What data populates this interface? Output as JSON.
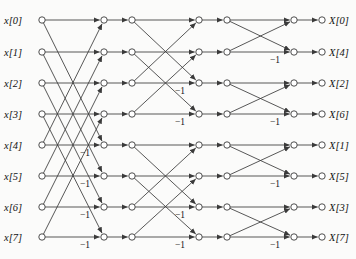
{
  "figure": {
    "stages": 3,
    "n_points": 8,
    "colors": {
      "background": "#fbfbfa",
      "line": "#3a3a3a",
      "node_fill": "#ffffff",
      "text": "#111111"
    }
  },
  "inputs": [
    {
      "label": "x[0]",
      "row": 0
    },
    {
      "label": "x[1]",
      "row": 1
    },
    {
      "label": "x[2]",
      "row": 2
    },
    {
      "label": "x[3]",
      "row": 3
    },
    {
      "label": "x[4]",
      "row": 4
    },
    {
      "label": "x[5]",
      "row": 5
    },
    {
      "label": "x[6]",
      "row": 6
    },
    {
      "label": "x[7]",
      "row": 7
    }
  ],
  "outputs": [
    {
      "label": "X[0]",
      "row": 0
    },
    {
      "label": "X[4]",
      "row": 1
    },
    {
      "label": "X[2]",
      "row": 2
    },
    {
      "label": "X[6]",
      "row": 3
    },
    {
      "label": "X[1]",
      "row": 4
    },
    {
      "label": "X[5]",
      "row": 5
    },
    {
      "label": "X[3]",
      "row": 6
    },
    {
      "label": "X[7]",
      "row": 7
    }
  ],
  "geometry": {
    "row_y": [
      20,
      52,
      83,
      114,
      145,
      176,
      207,
      237
    ],
    "col_x": [
      42,
      104,
      132,
      199,
      227,
      294,
      322
    ],
    "node_r": 3.2
  },
  "stages_detail": [
    {
      "index": 1,
      "span": 4,
      "from_col": 0,
      "to_col": 1,
      "butterflies": [
        {
          "top_row": 0,
          "bot_row": 4
        },
        {
          "top_row": 1,
          "bot_row": 5
        },
        {
          "top_row": 2,
          "bot_row": 6
        },
        {
          "top_row": 3,
          "bot_row": 7
        }
      ],
      "twiddles": [
        {
          "row": 4,
          "base": "W",
          "sub": "N",
          "sup": "0"
        },
        {
          "row": 5,
          "base": "W",
          "sub": "N",
          "sup": "1"
        },
        {
          "row": 6,
          "base": "W",
          "sub": "N",
          "sup": "2"
        },
        {
          "row": 7,
          "base": "W",
          "sub": "N",
          "sup": "3"
        }
      ],
      "minus_one_rows": [
        4,
        5,
        6,
        7
      ],
      "minus_one_label": "−1"
    },
    {
      "index": 2,
      "span": 2,
      "from_col": 2,
      "to_col": 3,
      "butterflies": [
        {
          "top_row": 0,
          "bot_row": 2
        },
        {
          "top_row": 1,
          "bot_row": 3
        },
        {
          "top_row": 4,
          "bot_row": 6
        },
        {
          "top_row": 5,
          "bot_row": 7
        }
      ],
      "twiddles": [
        {
          "row": 2,
          "base": "W",
          "sub": "N",
          "sup": "0"
        },
        {
          "row": 3,
          "base": "W",
          "sub": "N",
          "sup": "2"
        },
        {
          "row": 6,
          "base": "W",
          "sub": "N",
          "sup": "0"
        },
        {
          "row": 7,
          "base": "W",
          "sub": "N",
          "sup": "2"
        }
      ],
      "minus_one_rows": [
        2,
        3,
        6,
        7
      ],
      "minus_one_label": "−1"
    },
    {
      "index": 3,
      "span": 1,
      "from_col": 4,
      "to_col": 5,
      "butterflies": [
        {
          "top_row": 0,
          "bot_row": 1
        },
        {
          "top_row": 2,
          "bot_row": 3
        },
        {
          "top_row": 4,
          "bot_row": 5
        },
        {
          "top_row": 6,
          "bot_row": 7
        }
      ],
      "twiddles": [
        {
          "row": 1,
          "base": "W",
          "sub": "N",
          "sup": "0"
        },
        {
          "row": 3,
          "base": "W",
          "sub": "N",
          "sup": "0"
        },
        {
          "row": 5,
          "base": "W",
          "sub": "N",
          "sup": "0"
        },
        {
          "row": 7,
          "base": "W",
          "sub": "N",
          "sup": "0"
        }
      ],
      "minus_one_rows": [
        1,
        3,
        5,
        7
      ],
      "minus_one_label": "−1"
    }
  ]
}
